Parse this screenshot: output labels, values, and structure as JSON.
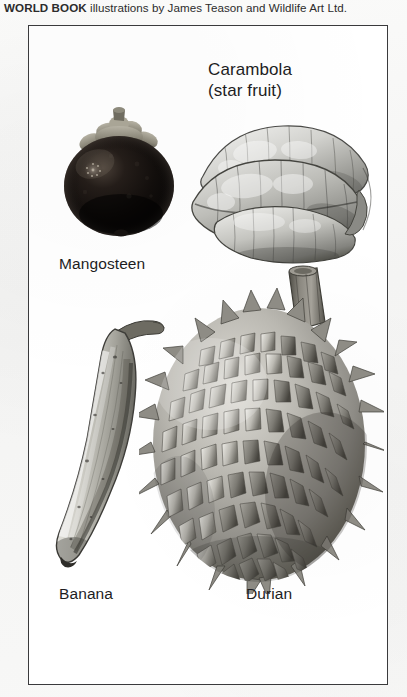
{
  "credit": {
    "brand": "WORLD BOOK",
    "text": " illustrations by James Teason and Wildlife Art Ltd.",
    "full": "WORLD BOOK illustrations by James Teason and Wildlife Art Ltd."
  },
  "plate": {
    "border_color": "#3a3a3c",
    "background_color": "#ffffff",
    "page_background_color": "#f7f7f6",
    "text_color": "#1d1d1f"
  },
  "figures": [
    {
      "id": "mangosteen",
      "label": "Mangosteen",
      "icon": "mangosteen-fruit-illustration",
      "description": "Dark near-black round fruit with pale green-grey calyx cap and short stem on top",
      "colors": {
        "body_dark": "#0d0b0a",
        "body_mid": "#2a2320",
        "highlight": "#6f625b",
        "calyx": "#8d8a7f",
        "calyx_shadow": "#4f4c44"
      }
    },
    {
      "id": "carambola",
      "label": "Carambola",
      "label_line2": "(star fruit)",
      "icon": "carambola-star-fruit-illustration",
      "description": "Grayscale pencil drawing of a star fruit seen end-on, showing rounded ribbed lobes with a deep groove between them",
      "colors": {
        "light": "#e8e8e6",
        "mid": "#b8b8b4",
        "dark": "#6e6e6a",
        "outline": "#4a4a47"
      }
    },
    {
      "id": "banana",
      "label": "Banana",
      "icon": "banana-fruit-illustration",
      "description": "Curved crescent banana, stem at upper right, speckled peel with dark ridge along the inner curve",
      "colors": {
        "light": "#dcdbd5",
        "mid": "#aaa9a2",
        "dark": "#6b6a64",
        "outline": "#3e3d39",
        "stem": "#5d5b53"
      }
    },
    {
      "id": "durian",
      "label": "Durian",
      "icon": "durian-fruit-illustration",
      "description": "Large oval fruit densely covered in rows of sharp pyramidal spikes, with a thick cut woody stem at the top",
      "colors": {
        "light": "#dedcd6",
        "mid": "#a5a39c",
        "dark": "#63615b",
        "shadow": "#3c3b37",
        "stem": "#7b7870"
      }
    }
  ]
}
